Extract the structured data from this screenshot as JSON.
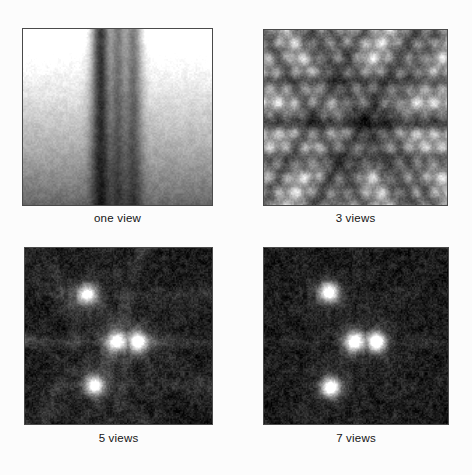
{
  "figure": {
    "background_color": "#fcfcfc",
    "border_color": "#4a4a4a",
    "caption_color": "#141414",
    "layout": "2x2 grid of grayscale images with captions beneath each",
    "panels": [
      {
        "id": "panel-one-view",
        "caption": "one view",
        "views": 1,
        "position": {
          "x": 22,
          "y": 28,
          "width": 191,
          "height": 178
        },
        "caption_y": 212,
        "pattern": "vertical-streaks",
        "description": "Single-projection backprojection: parallel vertical bands spanning full height, bright near top fading to dark at bottom",
        "projection_angles_deg": [
          90
        ],
        "sources": [
          {
            "x": 0.42,
            "y": 0.3,
            "intensity": 1.0
          },
          {
            "x": 0.5,
            "y": 0.52,
            "intensity": 1.0
          },
          {
            "x": 0.58,
            "y": 0.52,
            "intensity": 1.0
          },
          {
            "x": 0.4,
            "y": 0.74,
            "intensity": 1.0
          }
        ],
        "vertical_gradient": "bright top to dark bottom"
      },
      {
        "id": "panel-3-views",
        "caption": "3 views",
        "views": 3,
        "position": {
          "x": 263,
          "y": 29,
          "width": 185,
          "height": 177
        },
        "caption_y": 212,
        "pattern": "criss-cross-star",
        "description": "Three projection angles produce overlapping band families crossing at source locations; strong moire of bright and dark stripes",
        "projection_angles_deg": [
          0,
          60,
          120
        ],
        "sources": [
          {
            "x": 0.38,
            "y": 0.29,
            "intensity": 1.0
          },
          {
            "x": 0.56,
            "y": 0.52,
            "intensity": 1.0
          },
          {
            "x": 0.66,
            "y": 0.52,
            "intensity": 1.0
          },
          {
            "x": 0.4,
            "y": 0.74,
            "intensity": 1.0
          }
        ]
      },
      {
        "id": "panel-5-views",
        "caption": "5 views",
        "views": 5,
        "position": {
          "x": 24,
          "y": 247,
          "width": 189,
          "height": 178
        },
        "caption_y": 432,
        "pattern": "radial-streaks-with-dots",
        "description": "Five angles: four bright compact dots become visible on a darker mottled background with radial streak artifacts emanating outward",
        "projection_angles_deg": [
          0,
          36,
          72,
          108,
          144
        ],
        "sources": [
          {
            "x": 0.33,
            "y": 0.26,
            "intensity": 1.0
          },
          {
            "x": 0.49,
            "y": 0.53,
            "intensity": 1.0
          },
          {
            "x": 0.6,
            "y": 0.53,
            "intensity": 1.0
          },
          {
            "x": 0.37,
            "y": 0.78,
            "intensity": 1.0
          }
        ]
      },
      {
        "id": "panel-7-views",
        "caption": "7 views",
        "views": 7,
        "position": {
          "x": 263,
          "y": 247,
          "width": 186,
          "height": 178
        },
        "caption_y": 432,
        "pattern": "radial-streaks-with-dots",
        "description": "Seven angles: four dots are crisp and well separated; streak artifacts are fainter and the background is smoother and darker",
        "projection_angles_deg": [
          0,
          25.7,
          51.4,
          77.1,
          102.9,
          128.6,
          154.3
        ],
        "sources": [
          {
            "x": 0.35,
            "y": 0.25,
            "intensity": 1.0
          },
          {
            "x": 0.49,
            "y": 0.53,
            "intensity": 1.0
          },
          {
            "x": 0.61,
            "y": 0.53,
            "intensity": 1.0
          },
          {
            "x": 0.36,
            "y": 0.79,
            "intensity": 1.0
          }
        ]
      }
    ]
  }
}
